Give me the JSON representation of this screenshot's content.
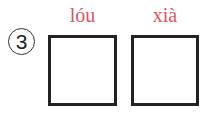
{
  "exercise": {
    "number": "3",
    "items": [
      {
        "pinyin": "lóu",
        "answer": ""
      },
      {
        "pinyin": "xià",
        "answer": ""
      }
    ],
    "colors": {
      "pinyin": "#d9555f",
      "box_border": "#222222"
    }
  }
}
